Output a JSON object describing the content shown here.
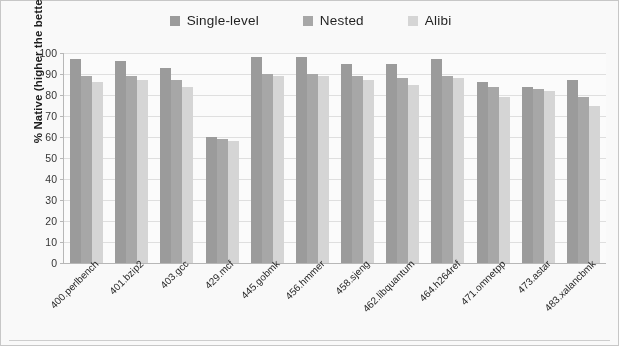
{
  "chart_data": {
    "type": "bar",
    "title": "",
    "xlabel": "",
    "ylabel": "% Native (higher the better)",
    "ylim": [
      0,
      100
    ],
    "yticks": [
      0,
      10,
      20,
      30,
      40,
      50,
      60,
      70,
      80,
      90,
      100
    ],
    "grid": true,
    "legend_position": "top-center",
    "categories": [
      "400.perlbench",
      "401.bzip2",
      "403.gcc",
      "429.mcf",
      "445.gobmk",
      "456.hmmer",
      "458.sjeng",
      "462.libquantum",
      "464.h264ref",
      "471.omnetpp",
      "473.astar",
      "483.xalancbmk"
    ],
    "series": [
      {
        "name": "Single-level",
        "color": "#9c9c9c",
        "values": [
          97,
          96,
          93,
          60,
          98,
          98,
          95,
          95,
          97,
          86,
          84,
          87
        ]
      },
      {
        "name": "Nested",
        "color": "#a8a8a8",
        "values": [
          89,
          89,
          87,
          59,
          90,
          90,
          89,
          88,
          89,
          84,
          83,
          79
        ]
      },
      {
        "name": "Alibi",
        "color": "#d8d8d8",
        "values": [
          86,
          87,
          84,
          58,
          89,
          89,
          87,
          85,
          88,
          79,
          82,
          75
        ]
      }
    ]
  }
}
